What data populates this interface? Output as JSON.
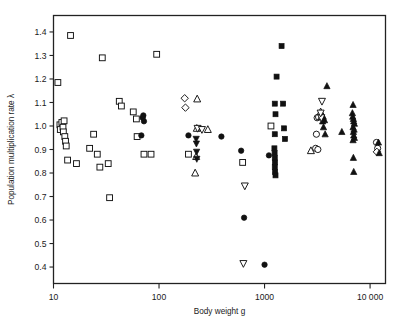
{
  "chart_data": {
    "type": "scatter",
    "title": "",
    "xlabel": "Body weight g",
    "ylabel": "Population multiplication rate λ",
    "xscale": "log",
    "yscale": "linear",
    "xlim": [
      10,
      14000
    ],
    "ylim": [
      0.33,
      1.47
    ],
    "xticks": [
      10,
      100,
      1000,
      10000
    ],
    "xticklabels": [
      "10",
      "100",
      "1000",
      "10 000"
    ],
    "yticks": [
      0.4,
      0.5,
      0.6,
      0.7,
      0.8,
      0.9,
      1.0,
      1.1,
      1.2,
      1.3,
      1.4
    ],
    "yticklabels": [
      "0.4",
      "0.5",
      "0.6",
      "0.7",
      "0.8",
      "0.9",
      "1.0",
      "1.1",
      "1.2",
      "1.3",
      "1.4"
    ],
    "grid": false,
    "legend": "none",
    "marker_color": "#111111",
    "frame_color": "#222222",
    "series": [
      {
        "name": "open-square",
        "marker": "square",
        "fill": "open",
        "points": [
          [
            11.0,
            1.185
          ],
          [
            11.5,
            1.005
          ],
          [
            11.6,
            0.985
          ],
          [
            12.0,
            1.015
          ],
          [
            12.3,
            0.995
          ],
          [
            12.4,
            0.975
          ],
          [
            12.6,
            1.022
          ],
          [
            12.8,
            0.955
          ],
          [
            13.0,
            0.935
          ],
          [
            13.2,
            0.915
          ],
          [
            13.6,
            0.855
          ],
          [
            14.5,
            1.385
          ],
          [
            16.5,
            0.84
          ],
          [
            22.0,
            0.905
          ],
          [
            24.0,
            0.965
          ],
          [
            26.0,
            0.88
          ],
          [
            27.5,
            0.825
          ],
          [
            29.0,
            1.29
          ],
          [
            33.0,
            0.84
          ],
          [
            34.0,
            0.695
          ],
          [
            42.0,
            1.105
          ],
          [
            44.0,
            1.085
          ],
          [
            57.0,
            1.06
          ],
          [
            61.0,
            1.03
          ],
          [
            62.0,
            0.955
          ],
          [
            72.0,
            0.88
          ],
          [
            84.0,
            0.88
          ],
          [
            95.0,
            1.305
          ],
          [
            190.0,
            0.88
          ],
          [
            620.0,
            0.845
          ],
          [
            1150.0,
            1.0
          ]
        ]
      },
      {
        "name": "filled-square",
        "marker": "square",
        "fill": "filled",
        "points": [
          [
            1450.0,
            1.34
          ],
          [
            1300.0,
            1.21
          ],
          [
            1250.0,
            1.095
          ],
          [
            1500.0,
            1.095
          ],
          [
            1270.0,
            1.05
          ],
          [
            1530.0,
            0.99
          ],
          [
            1560.0,
            0.945
          ],
          [
            1250.0,
            0.965
          ],
          [
            1240.0,
            0.905
          ],
          [
            1245.0,
            0.885
          ],
          [
            1250.0,
            0.865
          ],
          [
            1255.0,
            0.845
          ],
          [
            1250.0,
            0.825
          ],
          [
            1260.0,
            0.805
          ],
          [
            1270.0,
            0.79
          ]
        ]
      },
      {
        "name": "filled-circle",
        "marker": "circle",
        "fill": "filled",
        "points": [
          [
            68.0,
            0.96
          ],
          [
            70.0,
            1.035
          ],
          [
            71.0,
            1.045
          ],
          [
            72.0,
            1.02
          ],
          [
            190.0,
            0.96
          ],
          [
            390.0,
            0.955
          ],
          [
            600.0,
            0.895
          ],
          [
            640.0,
            0.61
          ],
          [
            1100.0,
            0.875
          ],
          [
            1000.0,
            0.41
          ]
        ]
      },
      {
        "name": "open-circle",
        "marker": "circle",
        "fill": "open",
        "points": [
          [
            3150.0,
            1.035
          ],
          [
            3250.0,
            1.038
          ],
          [
            3100.0,
            0.965
          ],
          [
            3050.0,
            0.905
          ],
          [
            3200.0,
            0.9
          ],
          [
            11500.0,
            0.93
          ],
          [
            11800.0,
            0.905
          ]
        ]
      },
      {
        "name": "open-diamond",
        "marker": "diamond",
        "fill": "open",
        "points": [
          [
            175.0,
            1.118
          ],
          [
            178.0,
            1.078
          ],
          [
            11600.0,
            0.89
          ]
        ]
      },
      {
        "name": "open-up-triangle",
        "marker": "triangle-up",
        "fill": "open",
        "points": [
          [
            230.0,
            1.115
          ],
          [
            228.0,
            0.99
          ],
          [
            290.0,
            0.985
          ],
          [
            225.0,
            0.87
          ],
          [
            220.0,
            0.8
          ],
          [
            2750.0,
            0.895
          ],
          [
            3400.0,
            1.06
          ],
          [
            3450.0,
            1.04
          ]
        ]
      },
      {
        "name": "filled-up-triangle",
        "marker": "triangle-up",
        "fill": "filled",
        "points": [
          [
            3900.0,
            1.17
          ],
          [
            3600.0,
            1.04
          ],
          [
            3700.0,
            1.025
          ],
          [
            3620.0,
            0.995
          ],
          [
            3750.0,
            0.965
          ],
          [
            3550.0,
            1.02
          ],
          [
            5400.0,
            0.975
          ],
          [
            6900.0,
            1.09
          ],
          [
            6800.0,
            1.055
          ],
          [
            6850.0,
            1.04
          ],
          [
            6950.0,
            1.03
          ],
          [
            7000.0,
            1.02
          ],
          [
            7100.0,
            1.01
          ],
          [
            6900.0,
            0.995
          ],
          [
            7050.0,
            0.985
          ],
          [
            6950.0,
            0.975
          ],
          [
            7000.0,
            0.96
          ],
          [
            6900.0,
            0.94
          ],
          [
            7100.0,
            0.95
          ],
          [
            6950.0,
            0.865
          ],
          [
            7000.0,
            0.805
          ],
          [
            12000.0,
            0.93
          ],
          [
            12200.0,
            0.885
          ]
        ]
      },
      {
        "name": "open-down-triangle",
        "marker": "triangle-down",
        "fill": "open",
        "points": [
          [
            232.0,
            0.99
          ],
          [
            255.0,
            0.985
          ],
          [
            650.0,
            0.745
          ],
          [
            630.0,
            0.415
          ],
          [
            3500.0,
            1.105
          ],
          [
            3450.0,
            1.035
          ],
          [
            3400.0,
            1.055
          ]
        ]
      },
      {
        "name": "filled-down-triangle",
        "marker": "triangle-down",
        "fill": "filled",
        "points": [
          [
            225.0,
            0.945
          ],
          [
            226.0,
            0.925
          ],
          [
            227.0,
            0.89
          ],
          [
            228.0,
            0.86
          ]
        ]
      }
    ]
  },
  "axes": {
    "x_axis_name": "x-axis",
    "y_axis_name": "y-axis"
  }
}
